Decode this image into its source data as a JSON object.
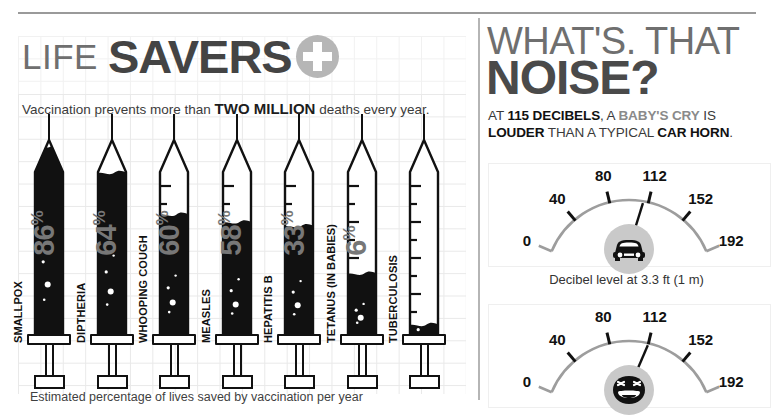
{
  "left": {
    "title_small": "LIFE",
    "title_big": "SAVERS",
    "badge_icon": "medical-cross-icon",
    "subtitle_pre": "Vaccination prevents more than ",
    "subtitle_em": "TWO MILLION",
    "subtitle_post": " deaths every year.",
    "footer": "Estimated percentage of lives saved by vaccination per year",
    "syringes": [
      {
        "disease": "SMALLPOX",
        "pct": 100,
        "pct_label": "100",
        "pct_symbol": "%"
      },
      {
        "disease": "DIPTHERIA",
        "pct": 86,
        "pct_label": "86",
        "pct_symbol": "%"
      },
      {
        "disease": "WHOOPING COUGH",
        "pct": 64,
        "pct_label": "64",
        "pct_symbol": "%"
      },
      {
        "disease": "MEASLES",
        "pct": 60,
        "pct_label": "60",
        "pct_symbol": "%"
      },
      {
        "disease": "HEPATITIS B",
        "pct": 58,
        "pct_label": "58",
        "pct_symbol": "%"
      },
      {
        "disease": "TETANUS (IN BABIES)",
        "pct": 33,
        "pct_label": "33",
        "pct_symbol": "%"
      },
      {
        "disease": "TUBERCULOSIS",
        "pct": 6,
        "pct_label": "6",
        "pct_symbol": "%"
      }
    ]
  },
  "right": {
    "title_line1": "WHAT'S. THAT",
    "title_line2": "NOISE?",
    "sub_line1_a": "AT ",
    "sub_line1_b": "115 DECIBELS",
    "sub_line1_c": ", A ",
    "sub_line1_d": "BABY'S CRY",
    "sub_line1_e": " IS",
    "sub_line2_a": "LOUDER",
    "sub_line2_b": " THAN A TYPICAL ",
    "sub_line2_c": "CAR HORN",
    "sub_line2_d": ".",
    "caption": "Decibel level at 3.3 ft (1 m)",
    "gauges": [
      {
        "name": "car-gauge",
        "icon": "car-icon",
        "ticks": [
          "0",
          "40",
          "80",
          "112",
          "152",
          "192"
        ],
        "value": 110
      },
      {
        "name": "baby-gauge",
        "icon": "crying-baby-icon",
        "ticks": [
          "0",
          "40",
          "80",
          "112",
          "152",
          "192"
        ],
        "value": 115
      }
    ]
  },
  "chart_data": [
    {
      "type": "bar",
      "title": "LIFE SAVERS",
      "subtitle": "Vaccination prevents more than TWO MILLION deaths every year.",
      "xlabel": "",
      "ylabel": "Estimated percentage of lives saved by vaccination per year",
      "ylim": [
        0,
        100
      ],
      "categories": [
        "SMALLPOX",
        "DIPTHERIA",
        "WHOOPING COUGH",
        "MEASLES",
        "HEPATITIS B",
        "TETANUS (IN BABIES)",
        "TUBERCULOSIS"
      ],
      "values": [
        100,
        86,
        64,
        60,
        58,
        33,
        6
      ],
      "unit": "%",
      "grid": true,
      "legend": "none",
      "note": "Each bar is drawn as a syringe barrel filled to the given percentage."
    },
    {
      "type": "bar",
      "title": "WHAT'S. THAT NOISE?",
      "subtitle": "AT 115 DECIBELS, A BABY'S CRY IS LOUDER THAN A TYPICAL CAR HORN.",
      "xlabel": "",
      "ylabel": "Decibel level at 3.3 ft (1 m)",
      "ylim": [
        0,
        192
      ],
      "axis_ticks": [
        0,
        40,
        80,
        112,
        152,
        192
      ],
      "categories": [
        "Typical car horn",
        "Baby's cry"
      ],
      "values": [
        110,
        115
      ],
      "unit": "dB",
      "grid": false,
      "legend": "none",
      "note": "Two dial gauges; needles indicate decibel level on an arc scale from 0 to 192."
    }
  ]
}
